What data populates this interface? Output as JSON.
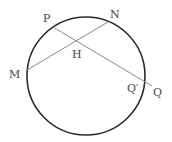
{
  "diagram": {
    "type": "geometry-circle-chords",
    "colors": {
      "circle": "#2a2a2a",
      "lines": "#8a8a8a",
      "labels": "#444444"
    },
    "circle": {
      "cx": 86,
      "cy": 76,
      "r": 59
    },
    "points": {
      "P": {
        "label": "P",
        "x": 53,
        "y": 27
      },
      "N": {
        "label": "N",
        "x": 108,
        "y": 22
      },
      "M": {
        "label": "M",
        "x": 27,
        "y": 70
      },
      "H": {
        "label": "H",
        "x": 77,
        "y": 42
      },
      "Q_prime": {
        "label": "Q′",
        "x": 144,
        "y": 81
      },
      "Q": {
        "label": "Q",
        "x": 152,
        "y": 86
      }
    },
    "segments": [
      {
        "from": "M",
        "to": "N"
      },
      {
        "from": "P",
        "to": "Q"
      }
    ]
  }
}
